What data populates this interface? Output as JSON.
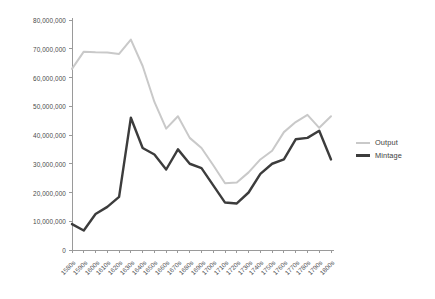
{
  "chart_data": {
    "type": "line",
    "title": "",
    "subtitle": "",
    "xlabel": "",
    "ylabel": "",
    "grid": false,
    "legend_position": "right",
    "ylim": [
      0,
      80000000
    ],
    "yticks": [
      0,
      10000000,
      20000000,
      30000000,
      40000000,
      50000000,
      60000000,
      70000000,
      80000000
    ],
    "ytick_labels": [
      "0",
      "10,000,000",
      "20,000,000",
      "30,000,000",
      "40,000,000",
      "50,000,000",
      "60,000,000",
      "70,000,000",
      "80,000,000"
    ],
    "categories": [
      "1580s",
      "1590s",
      "1600s",
      "1610s",
      "1620s",
      "1630s",
      "1640s",
      "1650s",
      "1660s",
      "1670s",
      "1680s",
      "1690s",
      "1700s",
      "1710s",
      "1720s",
      "1730s",
      "1740s",
      "1750s",
      "1760s",
      "1770s",
      "1780s",
      "1790s",
      "1800s"
    ],
    "series": [
      {
        "name": "Output",
        "color": "#c9c9c9",
        "values": [
          63000000,
          69000000,
          68800000,
          68700000,
          68200000,
          73200000,
          64000000,
          51500000,
          42200000,
          46500000,
          39000000,
          35500000,
          29500000,
          23200000,
          23500000,
          27000000,
          31500000,
          34500000,
          41000000,
          44500000,
          47000000,
          42500000,
          46500000
        ]
      },
      {
        "name": "Mintage",
        "color": "#3c3c3c",
        "values": [
          9000000,
          6800000,
          12500000,
          15000000,
          18500000,
          46000000,
          35500000,
          33200000,
          28000000,
          35000000,
          30000000,
          28500000,
          22500000,
          16500000,
          16200000,
          20000000,
          26500000,
          30000000,
          31500000,
          38500000,
          39000000,
          41500000,
          31500000
        ]
      }
    ]
  },
  "legend": {
    "items": [
      {
        "label": "Output",
        "color": "#c9c9c9",
        "width": 2.0
      },
      {
        "label": "Mintage",
        "color": "#3c3c3c",
        "width": 3.0
      }
    ]
  },
  "axes": {
    "axis_color": "#9a9a9a",
    "tick_color": "#9a9a9a",
    "label_color": "#55565a"
  }
}
